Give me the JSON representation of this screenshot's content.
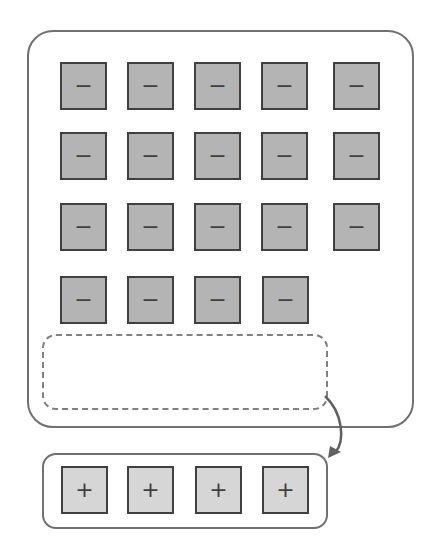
{
  "diagram": {
    "main_panel": {
      "rows": [
        [
          "−",
          "−",
          "−",
          "−",
          "−"
        ],
        [
          "−",
          "−",
          "−",
          "−",
          "−"
        ],
        [
          "−",
          "−",
          "−",
          "−",
          "−"
        ],
        [
          "−",
          "−",
          "−",
          "−"
        ]
      ],
      "drop_zone": ""
    },
    "tray": {
      "items": [
        "+",
        "+",
        "+",
        "+"
      ]
    },
    "colors": {
      "minus_fill": "#b4b4b4",
      "plus_fill": "#d6d6d6",
      "border": "#404040",
      "panel_border": "#707070"
    }
  }
}
